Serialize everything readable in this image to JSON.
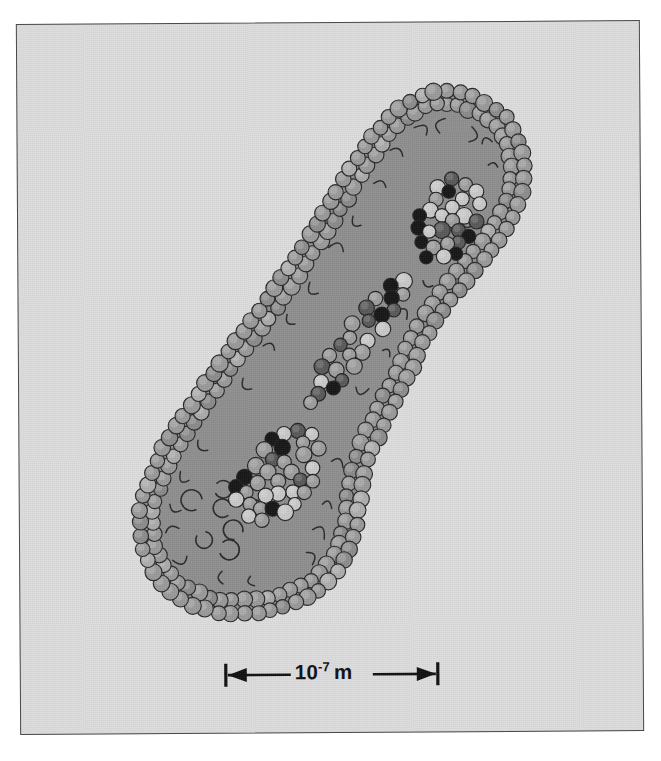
{
  "figure": {
    "name": "cell-cross-section-diagram",
    "kind": "grayscale-scientific-illustration",
    "orientation": "diagonal, lower-left to upper-right",
    "background_color": "#dddddd",
    "page_color": "#ffffff",
    "frame_border_color": "#4a4a4a"
  },
  "scale_bar": {
    "name": "scale-bar",
    "mantissa": "10",
    "exponent": "-7",
    "unit": "m",
    "full_label": "10-7 m",
    "arrow_style": "double-headed-with-end-caps",
    "color": "#111111",
    "pixel_length": 232
  },
  "structure": {
    "membrane": {
      "name": "membrane-layer",
      "description": "double row of gray spheres with short curved tails pointing inward",
      "sphere_fill": "#9a9a9a",
      "sphere_stroke": "#2a2a2a",
      "sphere_diameter_px": 16
    },
    "cytoplasm": {
      "name": "cytoplasm-body",
      "fill": "#8f8f8f",
      "stroke": "#3a3a3a"
    },
    "clusters": [
      {
        "name": "upper-granule-cluster",
        "position": "upper-right",
        "sphere_count": 78
      },
      {
        "name": "lower-granule-cluster",
        "position": "lower-left",
        "sphere_count": 86
      },
      {
        "name": "connecting-chain",
        "position": "center-diagonal",
        "sphere_count": 54
      }
    ],
    "granule_shades": [
      {
        "name": "light-granule",
        "hex": "#c9c9c9"
      },
      {
        "name": "medium-granule",
        "hex": "#9e9e9e"
      },
      {
        "name": "dark-granule",
        "hex": "#5a5a5a"
      },
      {
        "name": "black-granule",
        "hex": "#171717"
      }
    ]
  }
}
